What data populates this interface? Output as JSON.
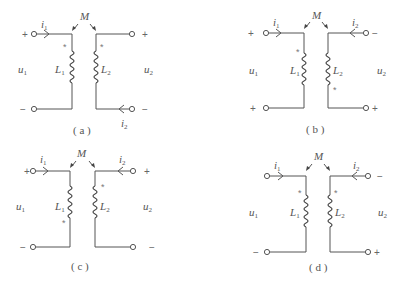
{
  "figure": {
    "panels": [
      {
        "id": "a",
        "caption": "( a )",
        "mutual_label": "M",
        "L1": "L",
        "L1_sub": "1",
        "L2": "L",
        "L2_sub": "2",
        "u1": "u",
        "u1_sub": "1",
        "u2": "u",
        "u2_sub": "2",
        "i1": "i",
        "i1_sub": "1",
        "i2": "i",
        "i2_sub": "2",
        "left_top_sign": "+",
        "left_bottom_sign": "−",
        "right_top_sign": "+",
        "right_bottom_sign": "−",
        "dot_symbol": "*",
        "dot_L1": "top",
        "dot_L2": "top",
        "i1_position": "top-left",
        "i2_position": "bottom-right"
      },
      {
        "id": "b",
        "caption": "( b )",
        "mutual_label": "M",
        "L1": "L",
        "L1_sub": "1",
        "L2": "L",
        "L2_sub": "2",
        "u1": "u",
        "u1_sub": "1",
        "u2": "u",
        "u2_sub": "2",
        "i1": "i",
        "i1_sub": "1",
        "i2": "i",
        "i2_sub": "2",
        "left_top_sign": "+",
        "left_bottom_sign": "+",
        "right_top_sign": "−",
        "right_bottom_sign": "+",
        "dot_symbol": "*",
        "dot_L1": "top",
        "dot_L2": "bottom",
        "i1_position": "top-left",
        "i2_position": "top-right"
      },
      {
        "id": "c",
        "caption": "( c )",
        "mutual_label": "M",
        "L1": "L",
        "L1_sub": "1",
        "L2": "L",
        "L2_sub": "2",
        "u1": "u",
        "u1_sub": "1",
        "u2": "u",
        "u2_sub": "2",
        "i1": "i",
        "i1_sub": "1",
        "i2": "i",
        "i2_sub": "2",
        "left_top_sign": "+",
        "left_bottom_sign": "−",
        "right_top_sign": "+",
        "right_bottom_sign": "−",
        "dot_symbol": "*",
        "dot_L1": "bottom",
        "dot_L2": "top",
        "i1_position": "top-left",
        "i2_position": "top-right"
      },
      {
        "id": "d",
        "caption": "( d )",
        "mutual_label": "M",
        "L1": "L",
        "L1_sub": "1",
        "L2": "L",
        "L2_sub": "2",
        "u1": "u",
        "u1_sub": "1",
        "u2": "u",
        "u2_sub": "2",
        "i1": "i",
        "i1_sub": "1",
        "i2": "i",
        "i2_sub": "2",
        "left_top_sign": "",
        "left_bottom_sign": "−",
        "right_top_sign": "−",
        "right_bottom_sign": "+",
        "dot_symbol": "*",
        "dot_L1": "top",
        "dot_L2": "top",
        "i1_position": "top-left",
        "i2_position": "top-right"
      }
    ]
  }
}
